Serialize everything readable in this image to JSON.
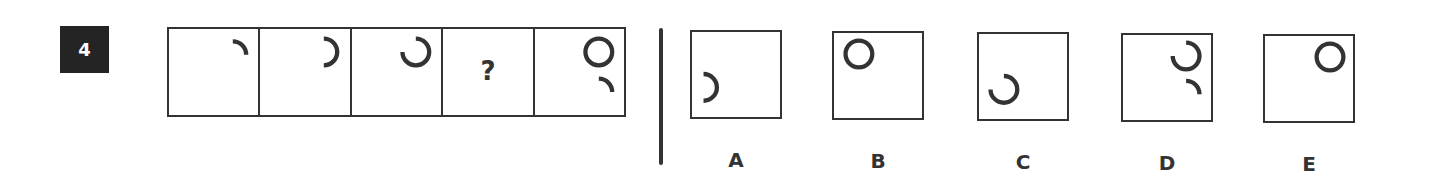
{
  "question": {
    "number": "4",
    "sequence": [
      {
        "position": 1,
        "content": "quarter-arc-top-right"
      },
      {
        "position": 2,
        "content": "half-arc-right-open-left"
      },
      {
        "position": 3,
        "content": "three-quarter-arc-open-top-left"
      },
      {
        "position": 4,
        "content": "missing",
        "label": "?"
      },
      {
        "position": 5,
        "content": "full-circle-with-quarter-arc-below"
      }
    ],
    "options": [
      {
        "label": "A",
        "content": "half-arc-bottom-left"
      },
      {
        "label": "B",
        "content": "full-circle-top-left"
      },
      {
        "label": "C",
        "content": "three-quarter-arc-bottom-left"
      },
      {
        "label": "D",
        "content": "three-quarter-arc-with-quarter-arc-below-right"
      },
      {
        "label": "E",
        "content": "full-circle-top-right"
      }
    ]
  },
  "colors": {
    "ink": "#333333",
    "badge_bg": "#242424",
    "badge_text": "#ffffff"
  }
}
